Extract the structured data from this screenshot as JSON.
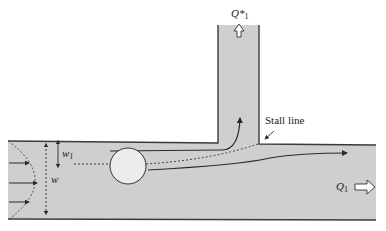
{
  "diagram": {
    "colors": {
      "fluid": "#cfcfcf",
      "wall": "#3a3a3a",
      "particle": "#ececec",
      "background": "#ffffff"
    },
    "labels": {
      "branch_outlet": "Q*",
      "branch_outlet_sub": "1",
      "main_outlet": "Q",
      "main_outlet_sub": "1",
      "stall_line": "Stall line",
      "channel_width": "w",
      "separation_width": "w",
      "separation_width_sub": "1"
    },
    "icons": {
      "branch_flow_arrow": "hollow-arrow-up",
      "main_flow_arrow": "hollow-arrow-right",
      "inlet_velocity_arrows": "arrow-right",
      "particle": "circle"
    }
  }
}
